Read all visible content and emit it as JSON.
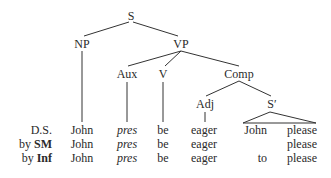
{
  "tree": {
    "nodes": {
      "S": "S",
      "NP": "NP",
      "VP": "VP",
      "Aux": "Aux",
      "V": "V",
      "Comp": "Comp",
      "Adj": "Adj",
      "S_prime": "S′"
    }
  },
  "rows": [
    {
      "label_prefix": "",
      "label_bold": "",
      "label_plain": "D.S.",
      "words": [
        "John",
        "pres",
        "be",
        "eager",
        "John",
        "please"
      ]
    },
    {
      "label_prefix": "by ",
      "label_bold": "SM",
      "label_plain": "",
      "words": [
        "John",
        "pres",
        "be",
        "eager",
        "",
        "please"
      ]
    },
    {
      "label_prefix": "by ",
      "label_bold": "Inf",
      "label_plain": "",
      "words": [
        "John",
        "pres",
        "be",
        "eager",
        "to",
        "please"
      ]
    }
  ]
}
